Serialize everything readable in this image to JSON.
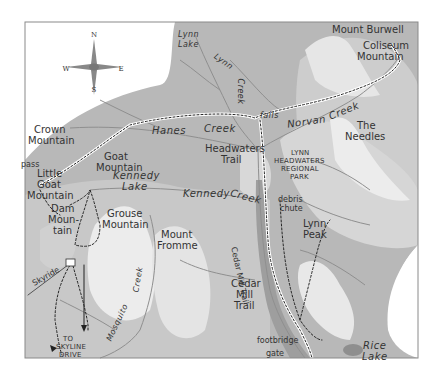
{
  "map": {
    "colors": {
      "background": "#ffffff",
      "frame": "#8a8a8a",
      "lowland": "#b8b8b8",
      "slope": "#cfcfcf",
      "ridge": "#e8e8e8",
      "peak": "#f6f6f6",
      "valley": "#a4a4a4",
      "creek": "#8f8f8f",
      "trail": "#222222",
      "trail_light": "#ffffff",
      "label": "#333333"
    },
    "compass": {
      "north": "N",
      "south": "S",
      "east": "E",
      "west": "W"
    },
    "peaks": {
      "mount_burwell": "Mount Burwell",
      "coliseum_1": "Coliseum",
      "coliseum_2": "Mountain",
      "crown_1": "Crown",
      "crown_2": "Mountain",
      "the_needles_1": "The",
      "the_needles_2": "Needles",
      "goat_1": "Goat",
      "goat_2": "Mountain",
      "little_goat_1": "Little",
      "little_goat_2": "Goat",
      "little_goat_3": "Mountain",
      "dam_1": "Dam",
      "dam_2": "Moun-",
      "dam_3": "tain",
      "grouse_1": "Grouse",
      "grouse_2": "Mountain",
      "fromme_1": "Mount",
      "fromme_2": "Fromme",
      "lynn_peak_1": "Lynn",
      "lynn_peak_2": "Peak"
    },
    "water": {
      "lynn_lake_1": "Lynn",
      "lynn_lake_2": "Lake",
      "lynn_creek_1": "Lynn",
      "lynn_creek_2": "Creek",
      "hanes_creek_1": "Hanes",
      "hanes_creek_2": "Creek",
      "norvan_creek_1": "Norvan",
      "norvan_creek_2": "Creek",
      "kennedy_lake_1": "Kennedy",
      "kennedy_lake_2": "Lake",
      "kennedy_creek_1": "Kennedy",
      "kennedy_creek_2": "Creek",
      "mosquito_creek_1": "Mosquito",
      "mosquito_creek_2": "Creek",
      "rice_lake_1": "Rice",
      "rice_lake_2": "Lake"
    },
    "features": {
      "falls": "falls",
      "pass": "pass",
      "headwaters_trail_1": "Headwaters",
      "headwaters_trail_2": "Trail",
      "park_1": "LYNN",
      "park_2": "HEADWATERS",
      "park_3": "REGIONAL",
      "park_4": "PARK",
      "debris_1": "debris",
      "debris_2": "chute",
      "cedar_mill_vertical": "Cedar Mill Trail",
      "cedar_mill_1": "Cedar",
      "cedar_mill_2": "Mill",
      "cedar_mill_3": "Trail",
      "footbridge": "footbridge",
      "gate": "gate",
      "skyride": "Skyride",
      "skyline_1": "TO",
      "skyline_2": "SKYLINE",
      "skyline_3": "DRIVE"
    }
  }
}
